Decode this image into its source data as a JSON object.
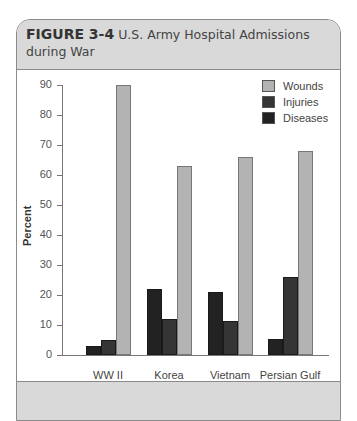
{
  "figure": {
    "label": "FIGURE 3-4",
    "title": "U.S. Army Hospital Admissions during War"
  },
  "chart_data": {
    "type": "bar",
    "title": "U.S. Army Hospital Admissions during War",
    "xlabel": "",
    "ylabel": "Percent",
    "ylim": [
      0,
      90
    ],
    "yticks": [
      0,
      10,
      20,
      30,
      40,
      50,
      60,
      70,
      80,
      90
    ],
    "grid": false,
    "legend_position": "top-right",
    "categories": [
      "WW II",
      "Korea",
      "Vietnam",
      "Persian Gulf"
    ],
    "series": [
      {
        "name": "Diseases",
        "color": "#222222",
        "values": [
          3,
          22,
          21,
          5.5
        ]
      },
      {
        "name": "Injuries",
        "color": "#353535",
        "values": [
          5,
          12,
          11.5,
          26
        ]
      },
      {
        "name": "Wounds",
        "color": "#b3b3b3",
        "values": [
          90,
          63,
          66,
          68
        ]
      }
    ],
    "legend": [
      "Wounds",
      "Injuries",
      "Diseases"
    ]
  },
  "colors": {
    "header_bg": "#d9d9d9",
    "border": "#8a8a8a",
    "wounds": "#b3b3b3",
    "injuries": "#353535",
    "diseases": "#222222"
  }
}
